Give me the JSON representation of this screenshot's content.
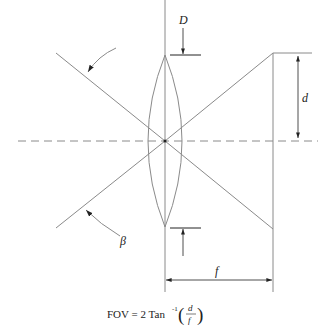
{
  "diagram": {
    "labels": {
      "lens_diameter": "D",
      "image_half_height": "d",
      "focal_length": "f",
      "angle": "β"
    },
    "formula": {
      "lhs": "FOV = 2 Tan",
      "exponent": "-1",
      "numerator": "d",
      "denominator": "f"
    },
    "colors": {
      "line": "#8a8a8a",
      "ink": "#222222",
      "background": "#ffffff"
    }
  }
}
